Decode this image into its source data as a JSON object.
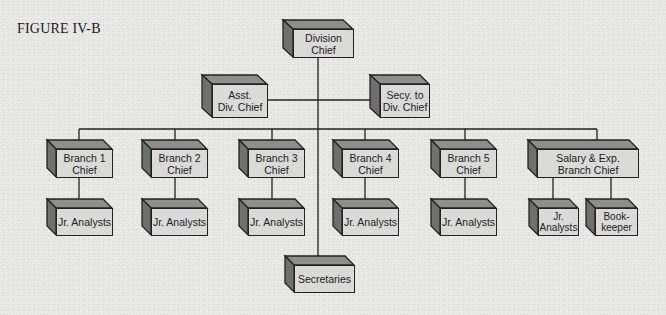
{
  "figure": {
    "title": "FIGURE IV-B"
  },
  "chart": {
    "top": {
      "label": "Division Chief",
      "line1": "Division",
      "line2": "Chief"
    },
    "staff": [
      {
        "id": "asst",
        "line1": "Asst.",
        "line2": "Div. Chief"
      },
      {
        "id": "secy",
        "line1": "Secy. to",
        "line2": "Div. Chief"
      }
    ],
    "branches": [
      {
        "line1": "Branch 1",
        "line2": "Chief",
        "subs": [
          {
            "line1": "Jr. Analysts",
            "line2": ""
          }
        ]
      },
      {
        "line1": "Branch 2",
        "line2": "Chief",
        "subs": [
          {
            "line1": "Jr. Analysts",
            "line2": ""
          }
        ]
      },
      {
        "line1": "Branch 3",
        "line2": "Chief",
        "subs": [
          {
            "line1": "Jr. Analysts",
            "line2": ""
          }
        ]
      },
      {
        "line1": "Branch 4",
        "line2": "Chief",
        "subs": [
          {
            "line1": "Jr. Analysts",
            "line2": ""
          }
        ]
      },
      {
        "line1": "Branch 5",
        "line2": "Chief",
        "subs": [
          {
            "line1": "Jr. Analysts",
            "line2": ""
          }
        ]
      },
      {
        "line1": "Salary & Exp.",
        "line2": "Branch Chief",
        "subs": [
          {
            "line1": "Jr.",
            "line2": "Analysts"
          },
          {
            "line1": "Book-",
            "line2": "keeper"
          }
        ]
      }
    ],
    "bottom": {
      "line1": "Secretaries",
      "line2": ""
    }
  },
  "colors": {
    "front": "#dadad8",
    "top": "#8e8e8c",
    "side": "#6f6f6d",
    "stroke": "#222222"
  }
}
